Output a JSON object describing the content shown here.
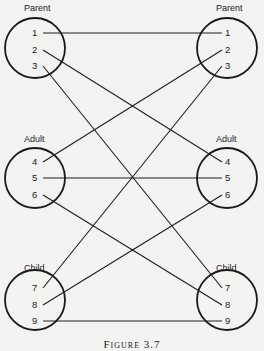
{
  "diagram": {
    "caption": "Figure 3.7",
    "left_groups": [
      {
        "label": "Parent",
        "items": [
          "1",
          "2",
          "3"
        ]
      },
      {
        "label": "Adult",
        "items": [
          "4",
          "5",
          "6"
        ]
      },
      {
        "label": "Child",
        "items": [
          "7",
          "8",
          "9"
        ]
      }
    ],
    "right_groups": [
      {
        "label": "Parent",
        "items": [
          "1",
          "2",
          "3"
        ]
      },
      {
        "label": "Adult",
        "items": [
          "4",
          "5",
          "6"
        ]
      },
      {
        "label": "Child",
        "items": [
          "7",
          "8",
          "9"
        ]
      }
    ],
    "connections": [
      {
        "from": "1",
        "to": "1"
      },
      {
        "from": "2",
        "to": "4"
      },
      {
        "from": "3",
        "to": "7"
      },
      {
        "from": "4",
        "to": "2"
      },
      {
        "from": "5",
        "to": "5"
      },
      {
        "from": "6",
        "to": "8"
      },
      {
        "from": "7",
        "to": "3"
      },
      {
        "from": "8",
        "to": "6"
      },
      {
        "from": "9",
        "to": "9"
      }
    ],
    "colors": {
      "line": "#1e1e1e",
      "background": "#f3f3f1"
    }
  }
}
